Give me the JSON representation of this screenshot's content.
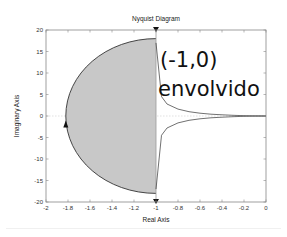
{
  "chart_data": {
    "type": "line",
    "title": "Nyquist Diagram",
    "xlabel": "Real Axis",
    "ylabel": "Imaginary Axis",
    "xlim": [
      -2,
      0
    ],
    "ylim": [
      -20,
      20
    ],
    "xticks": [
      -2,
      -1.8,
      -1.6,
      -1.4,
      -1.2,
      -1,
      -0.8,
      -0.6,
      -0.4,
      -0.2,
      0
    ],
    "xtick_labels": [
      "-2",
      "-1.8",
      "-1.6",
      "-1.4",
      "-1.2",
      "-1",
      "-0.8",
      "-0.6",
      "-0.4",
      "-0.2",
      "0"
    ],
    "yticks": [
      20,
      15,
      10,
      5,
      0,
      -5,
      -10,
      -15,
      -20
    ],
    "ytick_labels": [
      "20",
      "15",
      "10",
      "5",
      "0",
      "-5",
      "-10",
      "-15",
      "-20"
    ],
    "grid": false,
    "series": [
      {
        "name": "nyquist-curve-upper",
        "x": [
          -1.0,
          -0.95,
          -0.9,
          -0.8,
          -0.7,
          -0.6,
          -0.5,
          -0.4,
          -0.3,
          -0.2,
          -0.1,
          0
        ],
        "y": [
          17.0,
          4.5,
          2.8,
          1.6,
          1.0,
          0.65,
          0.42,
          0.27,
          0.16,
          0.08,
          0.03,
          0
        ]
      },
      {
        "name": "nyquist-curve-lower",
        "x": [
          -1.0,
          -0.95,
          -0.9,
          -0.8,
          -0.7,
          -0.6,
          -0.5,
          -0.4,
          -0.3,
          -0.2,
          -0.1,
          0
        ],
        "y": [
          -17.0,
          -4.5,
          -2.8,
          -1.6,
          -1.0,
          -0.65,
          -0.42,
          -0.27,
          -0.16,
          -0.08,
          -0.03,
          0
        ]
      },
      {
        "name": "encirclement-arc",
        "center": [
          -1,
          0
        ],
        "x_extent_min": -1.82,
        "y_extent": 18,
        "filled": true,
        "fill_color": "#c8c8c8"
      }
    ],
    "markers": [
      {
        "name": "arrow-top",
        "x": -1,
        "y": 20,
        "direction": "down"
      },
      {
        "name": "arrow-bottom",
        "x": -1,
        "y": -20,
        "direction": "down"
      },
      {
        "name": "arrow-left-arc",
        "x": -1.82,
        "y": -2,
        "direction": "up"
      }
    ],
    "annotation": {
      "line1": "(-1,0)",
      "line2": "envolvido",
      "x": -0.95,
      "y": 13
    },
    "colors": {
      "fill": "#c8c8c8",
      "curve": "#333333",
      "axis": "#888888",
      "zero_line": "#cccccc"
    }
  }
}
